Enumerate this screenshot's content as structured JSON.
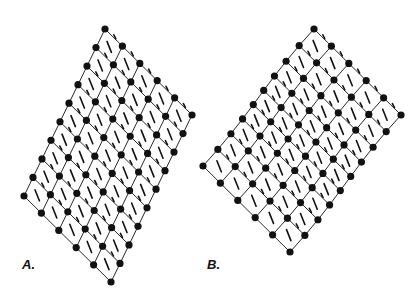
{
  "figure": {
    "background": "#ffffff",
    "ink_color": "#111111",
    "node_radius": 3.6,
    "bond_width": 0.9,
    "dash_width": 1.6
  },
  "panels": [
    {
      "label": "A.",
      "description": "Undeformed rhombic lattice of circular nodes joined by thin bonds with short diagonal dashes in each cell",
      "corners": {
        "top": [
          105,
          29
        ],
        "right": [
          192,
          115
        ],
        "bottom": [
          109,
          283
        ],
        "left": [
          24,
          196
        ]
      },
      "cells_u": 5,
      "cells_v": 9,
      "deformation": "none"
    },
    {
      "label": "B.",
      "description": "Same lattice with a sinusoidal shear (kink band) deformation across the middle rows",
      "corners": {
        "top": [
          314,
          29
        ],
        "right": [
          401,
          115
        ],
        "bottom": [
          289,
          253
        ],
        "left": [
          203,
          166
        ]
      },
      "cells_u": 5,
      "cells_v": 9,
      "deformation": "wave",
      "wave_amplitude": 14
    }
  ]
}
